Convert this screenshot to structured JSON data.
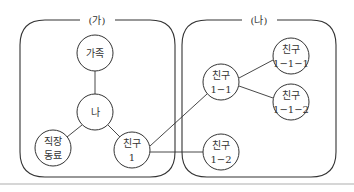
{
  "diagram": {
    "groups": [
      {
        "id": "ga",
        "label": "(가)"
      },
      {
        "id": "na",
        "label": "(나)"
      }
    ],
    "nodes": {
      "family": {
        "line1": "가족",
        "line2": ""
      },
      "me": {
        "line1": "나",
        "line2": ""
      },
      "coworker": {
        "line1": "직장",
        "line2": "동료"
      },
      "friend1": {
        "line1": "친구",
        "line2": "1"
      },
      "friend1_1": {
        "line1": "친구",
        "line2": "1−1"
      },
      "friend1_1_1": {
        "line1": "친구",
        "line2": "1−1−1"
      },
      "friend1_1_2": {
        "line1": "친구",
        "line2": "1−1−2"
      },
      "friend1_2": {
        "line1": "친구",
        "line2": "1−2"
      }
    },
    "edges": [
      [
        "family",
        "me"
      ],
      [
        "me",
        "coworker"
      ],
      [
        "me",
        "friend1"
      ],
      [
        "friend1",
        "friend1_1"
      ],
      [
        "friend1",
        "friend1_2"
      ],
      [
        "friend1_1",
        "friend1_1_1"
      ],
      [
        "friend1_1",
        "friend1_1_2"
      ]
    ],
    "colors": {
      "stroke": "#333333",
      "background": "#ffffff",
      "rule": "#d6d6d6"
    }
  }
}
